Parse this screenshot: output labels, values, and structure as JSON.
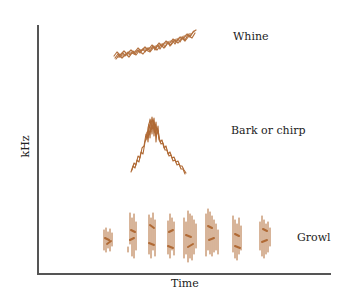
{
  "figure": {
    "axes": {
      "x_label": "Time",
      "y_label": "kHz"
    },
    "ink_color": "#b06a35",
    "vocalizations": [
      {
        "label": "Whine",
        "shape": "rising noisy band"
      },
      {
        "label": "Bark or chirp",
        "shape": "inverted V"
      },
      {
        "label": "Growl",
        "shape": "repeated vertical broadband bursts",
        "burst_count": 8
      }
    ]
  }
}
